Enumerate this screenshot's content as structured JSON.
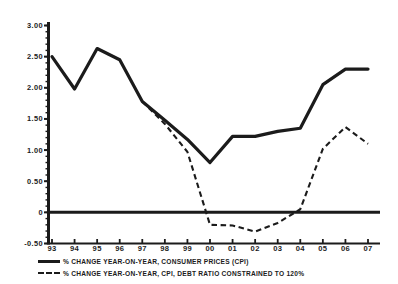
{
  "chart_data": {
    "type": "line",
    "title": "",
    "subtitle": "",
    "xlabel": "",
    "ylabel": "",
    "x": [
      "93",
      "94",
      "95",
      "96",
      "97",
      "98",
      "99",
      "00",
      "01",
      "02",
      "03",
      "04",
      "05",
      "06",
      "07"
    ],
    "categories": [
      "93",
      "94",
      "95",
      "96",
      "97",
      "98",
      "99",
      "00",
      "01",
      "02",
      "03",
      "04",
      "05",
      "06",
      "07"
    ],
    "ylim": [
      -0.5,
      3.0
    ],
    "ytick_labels": [
      "3.00",
      "2.50",
      "2.00",
      "1.50",
      "1.00",
      "0.50",
      "0",
      "-0.50"
    ],
    "ytick_values": [
      3.0,
      2.5,
      2.0,
      1.5,
      1.0,
      0.5,
      0,
      -0.5
    ],
    "grid": false,
    "legend_position": "below-left",
    "zero_line": 0,
    "series": [
      {
        "name": "% CHANGE YEAR-ON-YEAR, CONSUMER PRICES (CPI)",
        "style": "solid",
        "color": "#1b1b1b",
        "values": [
          2.5,
          1.98,
          2.63,
          2.45,
          1.78,
          1.48,
          1.17,
          0.8,
          1.22,
          1.22,
          1.3,
          1.35,
          2.05,
          2.3,
          2.3
        ]
      },
      {
        "name": "% CHANGE YEAR-ON-YEAR, CPI, DEBT RATIO CONSTRAINED TO 120%",
        "style": "dashed",
        "color": "#1b1b1b",
        "values": [
          null,
          null,
          null,
          null,
          1.78,
          1.42,
          0.97,
          -0.2,
          -0.21,
          -0.31,
          -0.17,
          0.05,
          1.02,
          1.37,
          1.1
        ]
      }
    ]
  },
  "legend": {
    "items": [
      {
        "label": "% CHANGE YEAR-ON-YEAR, CONSUMER PRICES (CPI)",
        "style": "solid"
      },
      {
        "label": "% CHANGE YEAR-ON-YEAR, CPI, DEBT RATIO CONSTRAINED TO 120%",
        "style": "dashed"
      }
    ]
  }
}
